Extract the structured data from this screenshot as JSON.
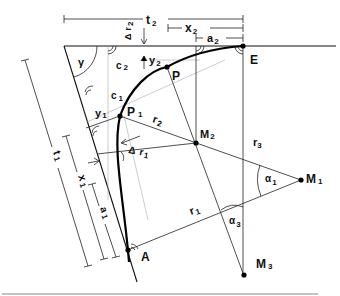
{
  "diagram": {
    "points": {
      "E": "E",
      "P": "P",
      "P1": {
        "main": "P",
        "sub": "1"
      },
      "A": "A",
      "M1": {
        "main": "M",
        "sub": "1"
      },
      "M2": {
        "main": "M",
        "sub": "2"
      },
      "M3": {
        "main": "M",
        "sub": "3"
      }
    },
    "dimensions": {
      "t2": {
        "main": "t",
        "sub": "2"
      },
      "x2": {
        "main": "x",
        "sub": "2"
      },
      "a2": {
        "main": "a",
        "sub": "2"
      },
      "t1": {
        "main": "t",
        "sub": "1"
      },
      "x1": {
        "main": "x",
        "sub": "1"
      },
      "a1": {
        "main": "a",
        "sub": "1"
      }
    },
    "radii": {
      "r1": {
        "main": "r",
        "sub": "1"
      },
      "r2": {
        "main": "r",
        "sub": "2"
      },
      "r3": {
        "main": "r",
        "sub": "3"
      },
      "delta_r1": {
        "delta": "Δ",
        "main": "r",
        "sub": "1"
      },
      "delta_r2": {
        "delta": "Δ",
        "main": "r",
        "sub": "2"
      }
    },
    "offsets": {
      "y1": {
        "main": "y",
        "sub": "1"
      },
      "y2": {
        "main": "y",
        "sub": "2"
      },
      "c1": {
        "main": "c",
        "sub": "1"
      },
      "c2": {
        "main": "c",
        "sub": "2"
      }
    },
    "angles": {
      "gamma": "γ",
      "alpha1": {
        "main": "α",
        "sub": "1"
      },
      "alpha3": {
        "main": "α",
        "sub": "3"
      }
    }
  }
}
